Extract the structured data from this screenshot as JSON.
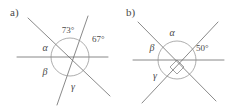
{
  "figure": {
    "type": "geometry-diagram",
    "background_color": "#ffffff",
    "line_color": "#6b6b6b",
    "arc_color": "#8a8a8a",
    "text_color": "#4a4a4a",
    "panels": [
      {
        "label": "a)",
        "label_pos": {
          "x": 10,
          "y": 16
        },
        "intersection": {
          "x": 70,
          "y": 57
        },
        "arc_radius": 19,
        "lines": [
          {
            "name": "horizontal-line",
            "x1": 17,
            "y1": 57,
            "x2": 108,
            "y2": 57
          },
          {
            "name": "steep-line",
            "x1": 88,
            "y1": 16,
            "x2": 57,
            "y2": 105
          },
          {
            "name": "shallow-diagonal-line",
            "x1": 28,
            "y1": 18,
            "x2": 110,
            "y2": 96
          }
        ],
        "angle_labels": [
          {
            "name": "angle-73",
            "text": "73°",
            "x": 68,
            "y": 33,
            "kind": "value"
          },
          {
            "name": "angle-67",
            "text": "67°",
            "x": 92,
            "y": 42,
            "kind": "value"
          },
          {
            "name": "angle-alpha",
            "text": "α",
            "x": 45,
            "y": 51,
            "kind": "greek"
          },
          {
            "name": "angle-beta",
            "text": "β",
            "x": 45,
            "y": 73,
            "kind": "greek"
          },
          {
            "name": "angle-gamma",
            "text": "γ",
            "x": 73,
            "y": 89,
            "kind": "greek"
          }
        ]
      },
      {
        "label": "b)",
        "label_pos": {
          "x": 126,
          "y": 16
        },
        "intersection": {
          "x": 177,
          "y": 60
        },
        "arc_radius": 19,
        "lines": [
          {
            "name": "horizontal-line",
            "x1": 133,
            "y1": 60,
            "x2": 224,
            "y2": 60
          },
          {
            "name": "diagonal-down-right-line",
            "x1": 138,
            "y1": 22,
            "x2": 216,
            "y2": 101
          },
          {
            "name": "diagonal-down-left-line",
            "x1": 218,
            "y1": 22,
            "x2": 142,
            "y2": 103
          }
        ],
        "angle_labels": [
          {
            "name": "angle-alpha",
            "text": "α",
            "x": 172,
            "y": 35,
            "kind": "greek"
          },
          {
            "name": "angle-beta",
            "text": "β",
            "x": 152,
            "y": 49,
            "kind": "greek"
          },
          {
            "name": "angle-gamma",
            "text": "γ",
            "x": 155,
            "y": 76,
            "kind": "greek"
          },
          {
            "name": "angle-50",
            "text": "50°",
            "x": 197,
            "y": 50,
            "kind": "value"
          }
        ],
        "right_angle_marker": {
          "x": 177,
          "y": 60,
          "size": 9
        }
      }
    ]
  }
}
